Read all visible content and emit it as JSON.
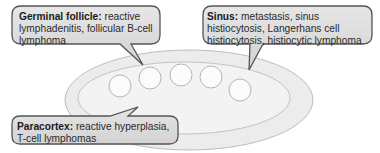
{
  "diagram": {
    "colors": {
      "callout_fill": "#dcdcdc",
      "callout_stroke": "#555555",
      "node_outer_fill": "#ececec",
      "node_inner_fill": "#f3f3f3",
      "follicle_fill": "#fafafa",
      "outline": "#b8b8b8"
    },
    "callouts": [
      {
        "id": "germinal-follicle",
        "term": "Germinal follicle:",
        "description": "reactive lymphadenitis, follicular B-cell lymphoma"
      },
      {
        "id": "sinus",
        "term": "Sinus:",
        "description": "metastasis, sinus histiocytosis, Langerhans cell histiocytosis, histiocytic lymphoma"
      },
      {
        "id": "paracortex",
        "term": "Paracortex:",
        "description": "reactive hyperplasia, T-cell lymphomas"
      }
    ],
    "follicle_count": 5
  }
}
